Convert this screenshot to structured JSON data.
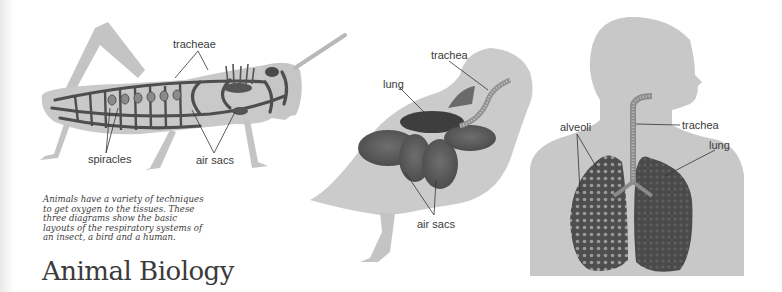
{
  "title": "Animal Biology",
  "caption": {
    "lines": [
      "Animals have a variety of techniques",
      "to get oxygen to the tissues. These",
      "three diagrams show the basic",
      "layouts of the respiratory systems of",
      "an insect, a bird and a human."
    ]
  },
  "diagrams": {
    "insect": {
      "name": "grasshopper",
      "labels": {
        "tracheae": "tracheae",
        "spiracles": "spiracles",
        "air_sacs": "air sacs"
      }
    },
    "bird": {
      "name": "pigeon",
      "labels": {
        "trachea": "trachea",
        "lung": "lung",
        "air_sacs": "air sacs"
      }
    },
    "human": {
      "name": "human",
      "labels": {
        "alveoli": "alveoli",
        "trachea": "trachea",
        "lung": "lung"
      }
    }
  },
  "colors": {
    "body_fill": "#c9c9c9",
    "organ_dark": "#5a5a5a",
    "label_text": "#3a3a3a",
    "background": "#ffffff"
  }
}
